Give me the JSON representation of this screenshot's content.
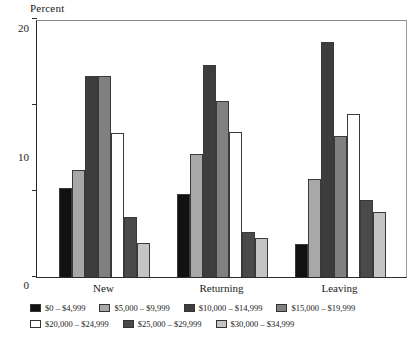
{
  "chart_data": {
    "type": "bar",
    "title": "",
    "ylabel": "Percent",
    "xlabel": "",
    "ylim": [
      0,
      30
    ],
    "yticks": [
      0,
      10,
      20,
      30
    ],
    "grid": false,
    "legend_position": "bottom",
    "categories": [
      "New",
      "Returning",
      "Leaving"
    ],
    "series": [
      {
        "name": "$0 – $4,999",
        "color": "#111111",
        "values": [
          10.3,
          9.7,
          3.8
        ]
      },
      {
        "name": "$5,000 – $9,999",
        "color": "#a8a8a8",
        "values": [
          12.4,
          14.3,
          11.4
        ]
      },
      {
        "name": "$10,000 – $14,999",
        "color": "#3d3d3d",
        "values": [
          23.4,
          24.7,
          27.3
        ]
      },
      {
        "name": "$15,000 – $19,999",
        "color": "#808080",
        "values": [
          23.4,
          20.5,
          16.4
        ]
      },
      {
        "name": "$20,000 – $24,999",
        "color": "#ffffff",
        "values": [
          16.7,
          16.9,
          18.9
        ]
      },
      {
        "name": "$25,000 – $29,999",
        "color": "#4a4a4a",
        "values": [
          7.0,
          5.2,
          8.9
        ]
      },
      {
        "name": "$30,000 – $34,999",
        "color": "#c4c4c4",
        "values": [
          3.9,
          4.5,
          7.6
        ]
      }
    ]
  },
  "axis": {
    "y_title": "Percent"
  }
}
